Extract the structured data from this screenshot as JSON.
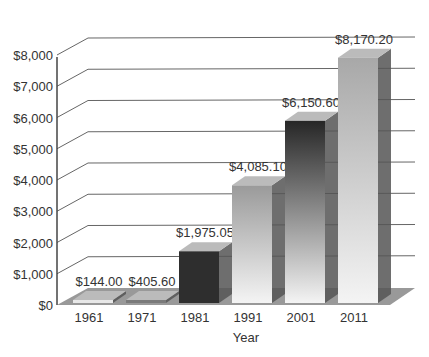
{
  "chart_data": {
    "type": "bar",
    "style": "3d-column",
    "title": "",
    "xlabel": "Year",
    "ylabel": "",
    "categories": [
      "1961",
      "1971",
      "1981",
      "1991",
      "2001",
      "2011"
    ],
    "values": [
      144.0,
      405.6,
      1975.05,
      4085.1,
      6150.6,
      8170.2
    ],
    "value_labels": [
      "$144.00",
      "$405.60",
      "$1,975.05",
      "$4,085.10",
      "$6,150.60",
      "$8,170.20"
    ],
    "y_ticks": [
      "$0",
      "$1,000",
      "$2,000",
      "$3,000",
      "$4,000",
      "$5,000",
      "$6,000",
      "$7,000",
      "$8,000"
    ],
    "ylim": [
      0,
      8000
    ],
    "grid": true,
    "legend": "none",
    "bar_colors": [
      "#e8e8e8",
      "#7a7a7a",
      "#2e2e2e",
      "#9a9a9a",
      "#262626",
      "#a8a8a8"
    ],
    "floor_color": "#999999"
  }
}
